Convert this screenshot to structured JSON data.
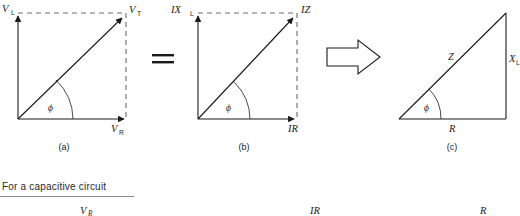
{
  "figure": {
    "type": "phasor-diagram-set",
    "diagrams": [
      {
        "id": "a",
        "caption": "(a)",
        "kind": "voltage-phasor-triangle",
        "vertical_label": "V",
        "vertical_label_sub": "L",
        "hypotenuse_label": "V",
        "hypotenuse_label_sub": "T",
        "horizontal_label": "V",
        "horizontal_label_sub": "R",
        "angle_label": "ϕ",
        "style": "arrowheads-with-dashed-closure"
      },
      {
        "id": "b",
        "caption": "(b)",
        "kind": "current-scaled-phasor-triangle",
        "vertical_label": "IX",
        "vertical_label_sub": "L",
        "hypotenuse_label": "IZ",
        "hypotenuse_label_sub": "",
        "horizontal_label": "IR",
        "horizontal_label_sub": "",
        "angle_label": "ϕ",
        "style": "arrowheads-with-dashed-closure"
      },
      {
        "id": "c",
        "caption": "(c)",
        "kind": "impedance-triangle",
        "vertical_label": "X",
        "vertical_label_sub": "L",
        "hypotenuse_label": "Z",
        "hypotenuse_label_sub": "",
        "horizontal_label": "R",
        "horizontal_label_sub": "",
        "angle_label": "ϕ",
        "style": "solid-closed-triangle"
      }
    ],
    "connectors": {
      "equals_sign": "=",
      "block_arrow": "⇒"
    }
  },
  "bottom_section": {
    "heading": "For a capacitive circuit",
    "partial_labels": [
      {
        "text": "V",
        "sub": "R",
        "italic": true
      },
      {
        "text": "IR",
        "sub": "",
        "italic": true
      },
      {
        "text": "R",
        "sub": "",
        "italic": true
      }
    ]
  },
  "colors": {
    "ink": "#1a1a1a",
    "dashed": "#6a6a6a",
    "rule": "#8a8a8a",
    "background": "#ffffff"
  }
}
